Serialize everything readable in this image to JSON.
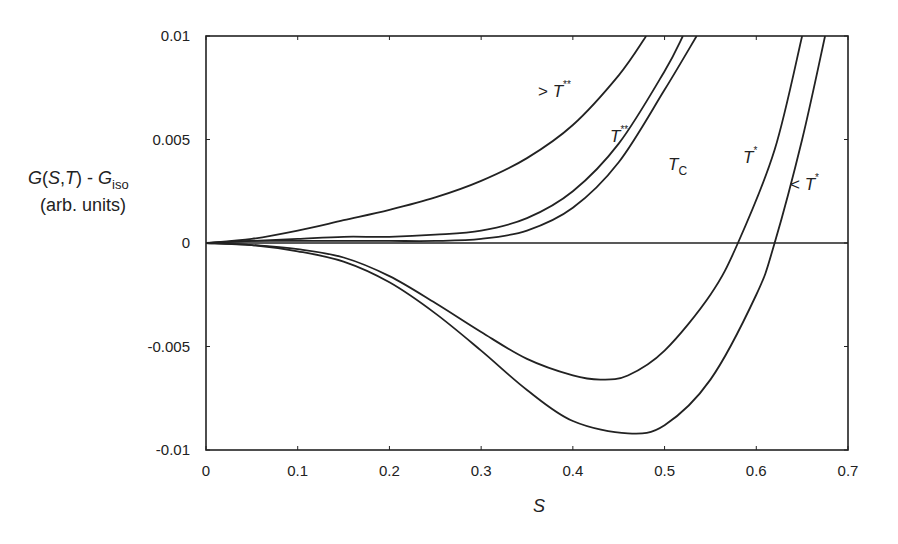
{
  "chart_data": {
    "type": "line",
    "title": "",
    "xlabel": "S",
    "ylabel": "G(S,T) - G_iso (arb. units)",
    "ylabel_parts": {
      "main": "G(S,T) - G",
      "sub": "iso",
      "units": "(arb. units)"
    },
    "xlim": [
      0,
      0.7
    ],
    "ylim": [
      -0.01,
      0.01
    ],
    "x_ticks": [
      "0",
      "0.1",
      "0.2",
      "0.3",
      "0.4",
      "0.5",
      "0.6",
      "0.7"
    ],
    "y_ticks": [
      "0.01",
      "0.005",
      "0",
      "-0.005",
      "-0.01"
    ],
    "grid": false,
    "legend": "inline annotations",
    "reference_line": {
      "y": 0
    },
    "series": [
      {
        "name": "> T**",
        "label_main": "> T",
        "label_sup": "**",
        "x": [
          0,
          0.05,
          0.1,
          0.15,
          0.2,
          0.25,
          0.3,
          0.35,
          0.4,
          0.45,
          0.48
        ],
        "y": [
          0,
          0.0002,
          0.0006,
          0.0011,
          0.0016,
          0.0022,
          0.003,
          0.0041,
          0.0057,
          0.0081,
          0.01
        ]
      },
      {
        "name": "T**",
        "label_main": "T",
        "label_sup": "**",
        "x": [
          0,
          0.05,
          0.1,
          0.15,
          0.2,
          0.25,
          0.3,
          0.35,
          0.4,
          0.45,
          0.5,
          0.52
        ],
        "y": [
          0,
          0.0001,
          0.0002,
          0.0003,
          0.0003,
          0.0004,
          0.0006,
          0.0012,
          0.0025,
          0.0048,
          0.0083,
          0.01
        ]
      },
      {
        "name": "Tc",
        "label_main": "T",
        "label_sub": "C",
        "x": [
          0,
          0.05,
          0.1,
          0.15,
          0.2,
          0.25,
          0.3,
          0.35,
          0.4,
          0.45,
          0.5,
          0.535
        ],
        "y": [
          0,
          0.0001,
          0.0001,
          0.0001,
          0.0001,
          0.0001,
          0.0002,
          0.0006,
          0.0017,
          0.0039,
          0.0074,
          0.01
        ]
      },
      {
        "name": "T*",
        "label_main": "T",
        "label_sup": "*",
        "x": [
          0,
          0.05,
          0.1,
          0.15,
          0.2,
          0.25,
          0.3,
          0.35,
          0.4,
          0.43,
          0.46,
          0.5,
          0.55,
          0.58,
          0.62,
          0.65
        ],
        "y": [
          0,
          -0.0001,
          -0.0003,
          -0.0007,
          -0.0016,
          -0.0029,
          -0.0043,
          -0.0056,
          -0.0064,
          -0.0066,
          -0.0064,
          -0.0052,
          -0.0025,
          0,
          0.0045,
          0.01
        ]
      },
      {
        "name": "< T*",
        "label_main": "< T",
        "label_sup": "*",
        "x": [
          0,
          0.05,
          0.1,
          0.15,
          0.2,
          0.25,
          0.3,
          0.35,
          0.4,
          0.46,
          0.5,
          0.55,
          0.6,
          0.62,
          0.65,
          0.675
        ],
        "y": [
          0,
          -0.0001,
          -0.0004,
          -0.0009,
          -0.0019,
          -0.0034,
          -0.0052,
          -0.0071,
          -0.0086,
          -0.0092,
          -0.0088,
          -0.0066,
          -0.0025,
          0,
          0.005,
          0.01
        ]
      }
    ]
  }
}
